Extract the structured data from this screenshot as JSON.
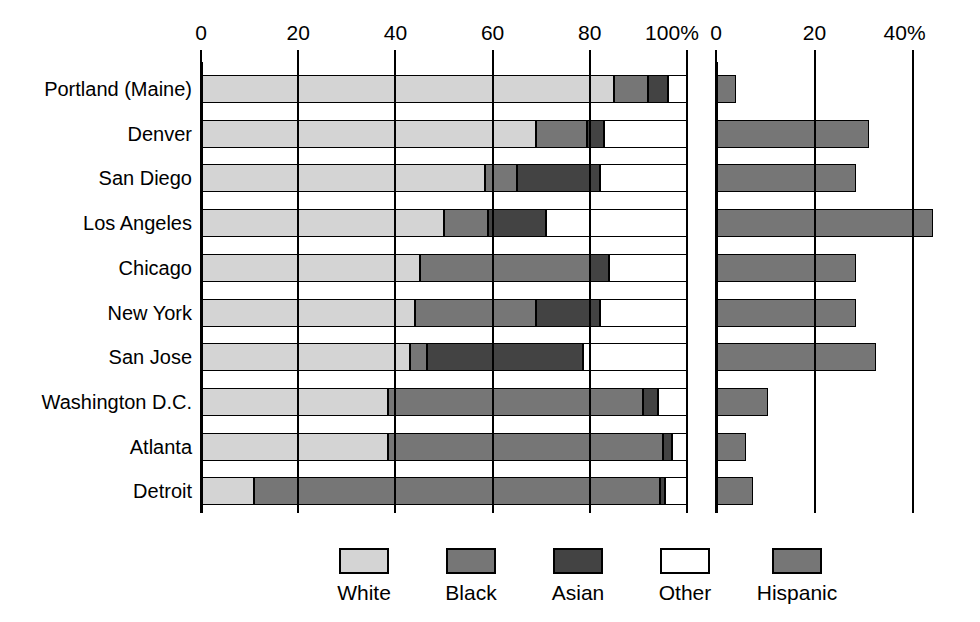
{
  "chart_data": {
    "type": "bar",
    "subtype": "stacked-horizontal-with-companion-panel",
    "title": "",
    "xlabel": "",
    "ylabel": "",
    "grid": true,
    "legend_position": "bottom",
    "categories": [
      "Portland (Maine)",
      "Denver",
      "San Diego",
      "Los Angeles",
      "Chicago",
      "New York",
      "San Jose",
      "Washington D.C.",
      "Atlanta",
      "Detroit"
    ],
    "panels": [
      {
        "name": "race-composition",
        "stacked": true,
        "xlim": [
          0,
          100
        ],
        "xticks": [
          0,
          20,
          40,
          60,
          80,
          100
        ],
        "xtick_labels": [
          "0",
          "20",
          "40",
          "60",
          "80",
          "100%"
        ],
        "series": [
          {
            "name": "White",
            "color": "#d4d4d4",
            "values": [
              85,
              69,
              58.5,
              50,
              45,
              44,
              43,
              38.5,
              38.5,
              11
            ]
          },
          {
            "name": "Black",
            "color": "#767676",
            "values": [
              7,
              10.5,
              6.5,
              9,
              35,
              25,
              3.5,
              52.5,
              56.5,
              83.5
            ]
          },
          {
            "name": "Asian",
            "color": "#434343",
            "values": [
              4,
              3.5,
              17,
              12,
              4,
              13,
              32,
              3,
              2,
              1
            ]
          },
          {
            "name": "Other",
            "color": "#ffffff",
            "values": [
              4,
              17,
              18,
              29,
              16,
              18,
              21.5,
              6,
              3,
              4.5
            ]
          }
        ],
        "cumulative_edges": {
          "Portland (Maine)": [
            85,
            92,
            96,
            100
          ],
          "Denver": [
            69,
            79.5,
            83,
            100
          ],
          "San Diego": [
            58.5,
            65,
            82,
            100
          ],
          "Los Angeles": [
            50,
            59,
            71,
            100
          ],
          "Chicago": [
            45,
            80,
            84,
            100
          ],
          "New York": [
            44,
            69,
            82,
            100
          ],
          "San Jose": [
            43,
            46.5,
            78.5,
            100
          ],
          "Washington D.C.": [
            38.5,
            91,
            94,
            100
          ],
          "Atlanta": [
            38.5,
            95,
            97,
            100
          ],
          "Detroit": [
            11,
            94.5,
            95.5,
            100
          ]
        }
      },
      {
        "name": "hispanic-share",
        "stacked": false,
        "xlim": [
          0,
          50
        ],
        "xticks": [
          0,
          20,
          40
        ],
        "xtick_labels": [
          "0",
          "20",
          "40%"
        ],
        "series": [
          {
            "name": "Hispanic",
            "color": "#767676",
            "values": [
              4,
              31,
              28.5,
              44,
              28.5,
              28.5,
              32.5,
              10.5,
              6,
              7.5
            ]
          }
        ]
      }
    ],
    "legend": [
      {
        "label": "White",
        "color": "#d4d4d4"
      },
      {
        "label": "Black",
        "color": "#767676"
      },
      {
        "label": "Asian",
        "color": "#434343"
      },
      {
        "label": "Other",
        "color": "#ffffff"
      },
      {
        "label": "Hispanic",
        "color": "#767676"
      }
    ]
  }
}
